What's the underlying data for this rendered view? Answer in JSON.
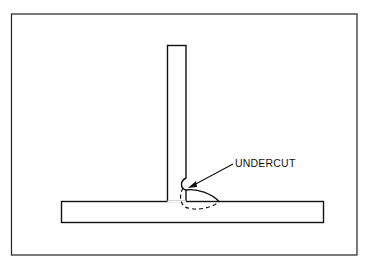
{
  "diagram": {
    "annotations": [
      {
        "text": "UNDERCUT",
        "target": "undercut-at-weld-toe"
      }
    ],
    "parts": [
      "vertical-plate",
      "horizontal-plate",
      "weld-bead",
      "penetration-outline"
    ],
    "colors": {
      "line": "#111111",
      "background": "#ffffff"
    }
  }
}
